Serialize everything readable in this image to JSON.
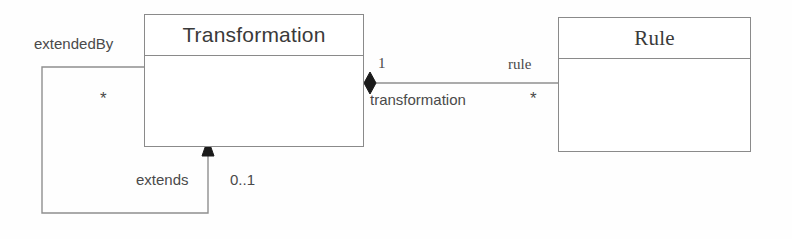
{
  "diagram": {
    "type": "uml-class-diagram",
    "classes": [
      {
        "id": "transformation",
        "name": "Transformation"
      },
      {
        "id": "rule",
        "name": "Rule"
      }
    ],
    "associations": [
      {
        "id": "transformation-rule",
        "kind": "composition",
        "source": "Transformation",
        "target": "Rule",
        "source_multiplicity": "1",
        "source_role": "transformation",
        "target_role": "rule",
        "target_multiplicity": "*"
      },
      {
        "id": "transformation-extends",
        "kind": "self-association",
        "source": "Transformation",
        "target": "Transformation",
        "source_role": "extendedBy",
        "source_multiplicity": "*",
        "target_role": "extends",
        "target_multiplicity": "0..1"
      }
    ],
    "colors": {
      "line": "#8a8a8a",
      "edge_line": "#8f8f8f",
      "text": "#4a4a4a",
      "fill": "#ffffff",
      "marker": "#1a1a1a"
    }
  }
}
